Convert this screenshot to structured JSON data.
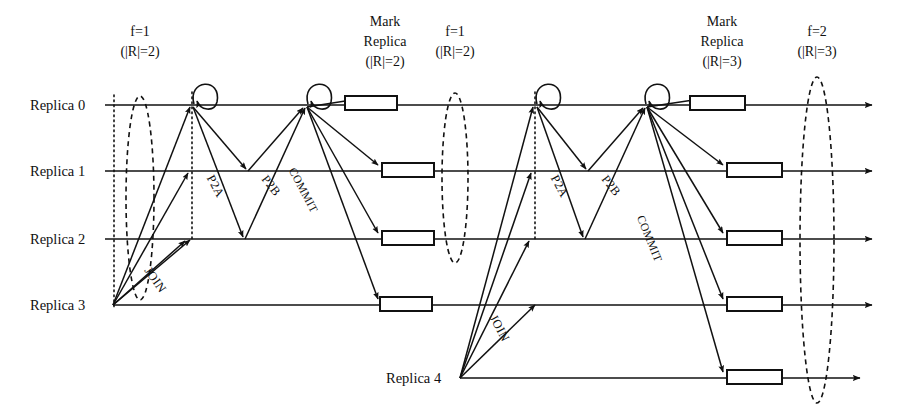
{
  "figure": {
    "kind": "sequence-diagram",
    "title_absent": true,
    "background": "#ffffff",
    "stroke": "#111111"
  },
  "lifelines": [
    {
      "id": "r0",
      "label": "Replica 0",
      "y": 105,
      "x_start": 105,
      "x_end": 872,
      "label_x": 30,
      "has_arrowhead": true
    },
    {
      "id": "r1",
      "label": "Replica 1",
      "y": 171,
      "x_start": 105,
      "x_end": 872,
      "label_x": 30,
      "has_arrowhead": true
    },
    {
      "id": "r2",
      "label": "Replica 2",
      "y": 239,
      "x_start": 105,
      "x_end": 872,
      "label_x": 30,
      "has_arrowhead": true
    },
    {
      "id": "r3",
      "label": "Replica 3",
      "y": 305,
      "x_start": 113,
      "x_end": 872,
      "label_x": 30,
      "has_arrowhead": true
    },
    {
      "id": "r4",
      "label": "Replica 4",
      "y": 378,
      "x_start": 460,
      "x_end": 860,
      "label_x": 386,
      "has_arrowhead": true
    }
  ],
  "phase_annotations": [
    {
      "id": "ph1",
      "line1": "f=1",
      "line2": "(|R|=2)",
      "x": 140,
      "y1": 36,
      "y2": 56
    },
    {
      "id": "ph2",
      "line1": "Mark Replica",
      "line2": "(|R|=2)",
      "x": 385,
      "y1": 26,
      "y2": 66,
      "lines": [
        "Mark",
        "Replica",
        "(|R|=2)"
      ]
    },
    {
      "id": "ph3",
      "line1": "f=1",
      "line2": "(|R|=2)",
      "x": 455,
      "y1": 36,
      "y2": 56
    },
    {
      "id": "ph4",
      "line1": "Mark Replica",
      "line2": "(|R|=3)",
      "x": 722,
      "y1": 26,
      "y2": 66,
      "lines": [
        "Mark",
        "Replica",
        "(|R|=3)"
      ]
    },
    {
      "id": "ph5",
      "line1": "f=2",
      "line2": "(|R|=3)",
      "x": 817,
      "y1": 36,
      "y2": 56
    }
  ],
  "dashed_ellipses": [
    {
      "id": "cut1",
      "cx": 140,
      "cy": 198,
      "rx": 14,
      "ry": 102
    },
    {
      "id": "cut2",
      "cx": 455,
      "cy": 178,
      "rx": 13,
      "ry": 85
    },
    {
      "id": "cut3",
      "cx": 817,
      "cy": 240,
      "rx": 17,
      "ry": 163
    }
  ],
  "dotted_verticals": [
    {
      "id": "dot1",
      "x": 114,
      "y1": 95,
      "y2": 307
    },
    {
      "id": "dot2",
      "x": 192,
      "y1": 92,
      "y2": 240
    },
    {
      "id": "dot3",
      "x": 535,
      "y1": 92,
      "y2": 242
    }
  ],
  "state_boxes": [
    {
      "id": "box-r0-a",
      "x": 345,
      "y": 96,
      "w": 52,
      "h": 14
    },
    {
      "id": "box-r1-a",
      "x": 382,
      "y": 163,
      "w": 52,
      "h": 14
    },
    {
      "id": "box-r2-a",
      "x": 382,
      "y": 231,
      "w": 52,
      "h": 14
    },
    {
      "id": "box-r3-a",
      "x": 380,
      "y": 297,
      "w": 52,
      "h": 14
    },
    {
      "id": "box-r0-b",
      "x": 690,
      "y": 96,
      "w": 55,
      "h": 14
    },
    {
      "id": "box-r1-b",
      "x": 727,
      "y": 163,
      "w": 55,
      "h": 14
    },
    {
      "id": "box-r2-b",
      "x": 727,
      "y": 231,
      "w": 55,
      "h": 14
    },
    {
      "id": "box-r3-b",
      "x": 727,
      "y": 297,
      "w": 55,
      "h": 14
    },
    {
      "id": "box-r4-b",
      "x": 727,
      "y": 370,
      "w": 55,
      "h": 14
    }
  ],
  "self_loops": [
    {
      "id": "loop-r0-1",
      "x": 196,
      "y": 105
    },
    {
      "id": "loop-r0-2",
      "x": 310,
      "y": 105
    },
    {
      "id": "loop-r0-3",
      "x": 539,
      "y": 105
    },
    {
      "id": "loop-r0-4",
      "x": 648,
      "y": 105
    }
  ],
  "messages": [
    {
      "id": "join-1-a",
      "label": "JOIN",
      "from": [
        113,
        305
      ],
      "to": [
        190,
        107
      ]
    },
    {
      "id": "join-1-b",
      "label": "",
      "from": [
        113,
        305
      ],
      "to": [
        185,
        241
      ]
    },
    {
      "id": "join-1-c",
      "label": "",
      "from": [
        113,
        305
      ],
      "to": [
        188,
        173
      ]
    },
    {
      "id": "join-1-d",
      "label": "JOIN",
      "from": [
        113,
        305
      ],
      "to": [
        190,
        240
      ],
      "label_x": 152,
      "label_y": 280
    },
    {
      "id": "p2a-1-r1",
      "label": "P2A",
      "from": [
        193,
        107
      ],
      "to": [
        246,
        169
      ],
      "label_x": 212,
      "label_y": 185
    },
    {
      "id": "p2a-1-r2",
      "label": "",
      "from": [
        193,
        107
      ],
      "to": [
        243,
        237
      ]
    },
    {
      "id": "p2b-1-r0-a",
      "label": "P2B",
      "from": [
        248,
        171
      ],
      "to": [
        303,
        108
      ],
      "label_x": 262,
      "label_y": 185
    },
    {
      "id": "p2b-1-r0-b",
      "label": "",
      "from": [
        245,
        239
      ],
      "to": [
        305,
        108
      ]
    },
    {
      "id": "commit-1-r0",
      "label": "COMMIT",
      "from": [
        307,
        107
      ],
      "to": [
        358,
        99
      ],
      "label_x": 298,
      "label_y": 195
    },
    {
      "id": "commit-1-r1",
      "label": "",
      "from": [
        307,
        107
      ],
      "to": [
        378,
        165
      ]
    },
    {
      "id": "commit-1-r2",
      "label": "",
      "from": [
        307,
        107
      ],
      "to": [
        378,
        233
      ]
    },
    {
      "id": "commit-1-r3",
      "label": "",
      "from": [
        307,
        107
      ],
      "to": [
        378,
        299
      ]
    },
    {
      "id": "join-2-a",
      "label": "JOIN",
      "from": [
        460,
        378
      ],
      "to": [
        533,
        107
      ],
      "label_x": 493,
      "label_y": 330
    },
    {
      "id": "join-2-b",
      "label": "",
      "from": [
        460,
        378
      ],
      "to": [
        531,
        173
      ]
    },
    {
      "id": "join-2-c",
      "label": "",
      "from": [
        460,
        378
      ],
      "to": [
        529,
        241
      ]
    },
    {
      "id": "join-2-d",
      "label": "",
      "from": [
        460,
        378
      ],
      "to": [
        535,
        305
      ]
    },
    {
      "id": "p2a-2-r1",
      "label": "P2A",
      "from": [
        537,
        107
      ],
      "to": [
        586,
        169
      ],
      "label_x": 552,
      "label_y": 185
    },
    {
      "id": "p2a-2-r2",
      "label": "",
      "from": [
        537,
        107
      ],
      "to": [
        583,
        237
      ]
    },
    {
      "id": "p2b-2-r0-a",
      "label": "P2B",
      "from": [
        588,
        171
      ],
      "to": [
        643,
        108
      ],
      "label_x": 602,
      "label_y": 185
    },
    {
      "id": "p2b-2-r0-b",
      "label": "",
      "from": [
        585,
        239
      ],
      "to": [
        645,
        108
      ]
    },
    {
      "id": "commit-2-r0",
      "label": "COMMIT",
      "from": [
        647,
        107
      ],
      "to": [
        700,
        99
      ],
      "label_x": 640,
      "label_y": 210
    },
    {
      "id": "commit-2-r1",
      "label": "",
      "from": [
        647,
        107
      ],
      "to": [
        723,
        165
      ]
    },
    {
      "id": "commit-2-r2",
      "label": "",
      "from": [
        647,
        107
      ],
      "to": [
        723,
        233
      ]
    },
    {
      "id": "commit-2-r3",
      "label": "",
      "from": [
        647,
        107
      ],
      "to": [
        723,
        299
      ]
    },
    {
      "id": "commit-2-r4",
      "label": "",
      "from": [
        647,
        107
      ],
      "to": [
        723,
        372
      ]
    }
  ],
  "message_labels": [
    {
      "id": "lbl-join-1",
      "text": "JOIN",
      "x": 152,
      "y": 282,
      "rot": -55
    },
    {
      "id": "lbl-p2a-1",
      "text": "P2A",
      "x": 212,
      "y": 188,
      "rot": -62
    },
    {
      "id": "lbl-p2b-1",
      "text": "P2B",
      "x": 268,
      "y": 188,
      "rot": -52
    },
    {
      "id": "lbl-commit-1",
      "text": "COMMIT",
      "x": 300,
      "y": 192,
      "rot": -62
    },
    {
      "id": "lbl-join-2",
      "text": "JOIN",
      "x": 496,
      "y": 330,
      "rot": -62
    },
    {
      "id": "lbl-p2a-2",
      "text": "P2A",
      "x": 556,
      "y": 188,
      "rot": -62
    },
    {
      "id": "lbl-p2b-2",
      "text": "P2B",
      "x": 608,
      "y": 188,
      "rot": -52
    },
    {
      "id": "lbl-commit-2",
      "text": "COMMIT",
      "x": 646,
      "y": 240,
      "rot": -68
    }
  ]
}
